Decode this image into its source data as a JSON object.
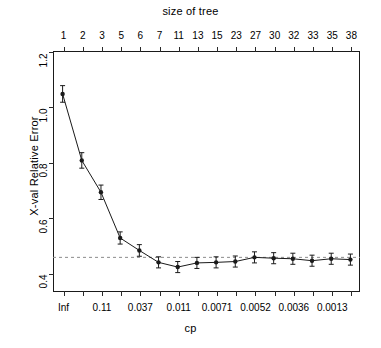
{
  "chart_data": {
    "type": "line",
    "title": "size of tree",
    "xlabel": "cp",
    "ylabel": "X-val Relative Error",
    "top_axis_label": "size of tree",
    "top_axis_ticks": [
      "1",
      "2",
      "3",
      "5",
      "6",
      "7",
      "11",
      "13",
      "15",
      "23",
      "27",
      "30",
      "32",
      "33",
      "35",
      "38"
    ],
    "bottom_axis_ticks": [
      "Inf",
      "",
      "0.11",
      "",
      "0.037",
      "",
      "0.011",
      "",
      "0.0071",
      "",
      "0.0052",
      "",
      "0.0036",
      "",
      "0.0013",
      ""
    ],
    "bottom_axis_labeled": [
      "Inf",
      "0.11",
      "0.037",
      "0.011",
      "0.0071",
      "0.0052",
      "0.0036",
      "0.0013"
    ],
    "y_ticks": [
      "0.4",
      "0.6",
      "0.8",
      "1.0",
      "1.2"
    ],
    "y_tick_values": [
      0.4,
      0.6,
      0.8,
      1.0,
      1.2
    ],
    "ylim": [
      0.33,
      1.2
    ],
    "xlim": [
      0,
      17
    ],
    "grid": false,
    "legend": null,
    "series": [
      {
        "name": "X-val Relative Error",
        "x": [
          1,
          2,
          3,
          4,
          5,
          6,
          7,
          8,
          9,
          10,
          11,
          12,
          13,
          14,
          15,
          16
        ],
        "values": [
          1.045,
          0.805,
          0.69,
          0.525,
          0.48,
          0.437,
          0.42,
          0.435,
          0.437,
          0.44,
          0.455,
          0.452,
          0.45,
          0.443,
          0.45,
          0.447
        ],
        "errors": [
          0.03,
          0.028,
          0.026,
          0.022,
          0.021,
          0.02,
          0.02,
          0.02,
          0.02,
          0.02,
          0.02,
          0.02,
          0.02,
          0.02,
          0.02,
          0.02
        ],
        "marker": "filled-circle",
        "color": "#1a1a1a"
      }
    ],
    "hline": {
      "value": 0.455,
      "style": "dashed",
      "color": "#8c8c8c"
    }
  }
}
